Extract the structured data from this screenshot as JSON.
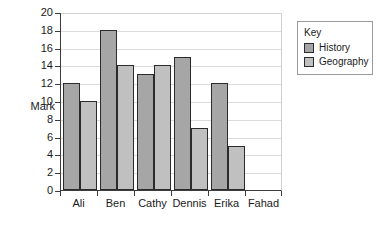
{
  "chart_data": {
    "type": "bar",
    "title": "",
    "xlabel": "",
    "ylabel": "Mark",
    "categories": [
      "Ali",
      "Ben",
      "Cathy",
      "Dennis",
      "Erika",
      "Fahad"
    ],
    "series": [
      {
        "name": "History",
        "values": [
          12,
          18,
          13,
          15,
          12,
          0
        ],
        "color": "#a6a6a6"
      },
      {
        "name": "Geography",
        "values": [
          10,
          14,
          14,
          7,
          5,
          0
        ],
        "color": "#c0c0c0"
      }
    ],
    "ylim": [
      0,
      20
    ],
    "y_ticks": [
      0,
      2,
      4,
      6,
      8,
      10,
      12,
      14,
      16,
      18,
      20
    ],
    "grid": true,
    "legend_position": "right"
  },
  "legend": {
    "title": "Key",
    "entries": [
      {
        "label": "History"
      },
      {
        "label": "Geography"
      }
    ]
  },
  "axis": {
    "y_label": "Mark",
    "y_tick_labels": [
      "0",
      "2",
      "4",
      "6",
      "8",
      "10",
      "12",
      "14",
      "16",
      "18",
      "20"
    ],
    "x_tick_labels": [
      "Ali",
      "Ben",
      "Cathy",
      "Dennis",
      "Erika",
      "Fahad"
    ]
  }
}
